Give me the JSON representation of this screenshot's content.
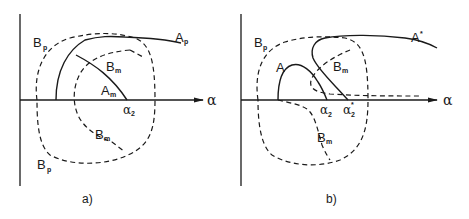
{
  "figure": {
    "panel_a": {
      "caption": "a)",
      "axis_label": "α",
      "curves": {
        "A_p": {
          "base": "A",
          "sub": "p"
        },
        "A_m": {
          "base": "A",
          "sub": "m"
        },
        "B_m_upper": {
          "base": "B",
          "sub": "m"
        },
        "B_m_lower": {
          "base": "B",
          "sub": "m"
        },
        "B_p_upper": {
          "base": "B",
          "sub": "p"
        },
        "B_p_lower": {
          "base": "B",
          "sub": "p"
        }
      },
      "alpha_mark": {
        "base": "α",
        "sub": "2"
      }
    },
    "panel_b": {
      "caption": "b)",
      "axis_label": "α",
      "curves": {
        "A_star": {
          "base": "A",
          "sup": "*"
        },
        "A": {
          "base": "A"
        },
        "B_m_upper": {
          "base": "B",
          "sub": "m"
        },
        "B_m_lower": {
          "base": "B",
          "sub": "m"
        },
        "B_p": {
          "base": "B",
          "sub": "p"
        }
      },
      "alpha_mark": {
        "base": "α",
        "sub": "2"
      },
      "alpha_star_mark": {
        "base": "α",
        "sub": "2",
        "sup": "*"
      }
    }
  }
}
